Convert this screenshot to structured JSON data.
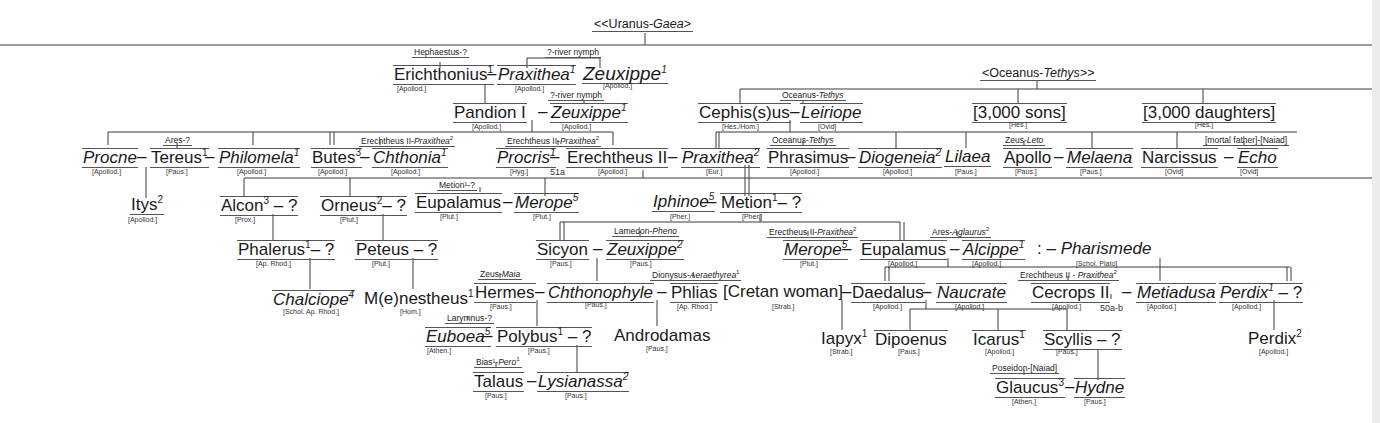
{
  "title_root": {
    "pre": "<<Uranus-",
    "it": "Gaea",
    "post": ">"
  },
  "oceanus_root": {
    "pre": "<Oceanus-",
    "it": "Tethys",
    "post": ">>"
  },
  "parents_labels": {
    "hephaestus": "Hephaestus-?",
    "river1": "?-river nymph",
    "river2": "?-river nymph",
    "ares": "Ares-?",
    "erechtheus_a": {
      "a": "Erechtheus II-",
      "b": "Praxithea",
      "sup": "2"
    },
    "erechtheus_b": {
      "a": "Erechtheus II-",
      "b": "Praxithea",
      "sup": "2"
    },
    "oceanus_a": {
      "a": "Oceanus-",
      "b": "Tethys"
    },
    "oceanus_b": {
      "a": "Oceanus-",
      "b": "Tethys"
    },
    "zeus_leto": {
      "a": "Zeus-",
      "b": "Leto"
    },
    "mortal": "[mortal father]-[Naiad]",
    "metion": "Metion¹-?",
    "lamedon": {
      "a": "Lamedon-",
      "b": "Pheno"
    },
    "erectheus_c": {
      "a": "Erectheus II-",
      "b": "Praxithea",
      "sup": "2"
    },
    "ares_aglaurus": {
      "a": "Ares-",
      "b": "Aglaurus",
      "sup": "2"
    },
    "erechtheus_d": {
      "a": "Erechtheus II - ",
      "b": "Praxithea",
      "sup": "2"
    },
    "zeus_maia": {
      "a": "Zeus-",
      "b": "Maia"
    },
    "dionysus": {
      "a": "Dionysus-",
      "b": "Aeraethyrea",
      "sup": "1"
    },
    "larymnus": "Larymnus-?",
    "bias": {
      "a": "Bias¹-",
      "b": "Pero",
      "sup": "1"
    },
    "poseidon": "Poseidon-[Naiad]"
  },
  "people": {
    "erichthonius": {
      "name": "Erichthonius",
      "sup": "1",
      "src": "[Apollod.]"
    },
    "praxithea1": {
      "name": "Praxithea",
      "sup": "1",
      "src": "[Apollod.]"
    },
    "zeuxippe1": {
      "name": "Zeuxippe",
      "sup": "1",
      "src": "[Apollod.]"
    },
    "pandion": {
      "name": "Pandion I",
      "src": "[Apollod.]"
    },
    "zeuxippe1b": {
      "name": "Zeuxippe",
      "sup": "1",
      "src": "[Apollod.]"
    },
    "cephisus": {
      "name": "Cephis(s)us",
      "src": "[Hes./Hom.]"
    },
    "leiriope": {
      "name": "Leiriope",
      "src": "[Ovid]"
    },
    "sons": {
      "name": "[3,000 sons]",
      "src": "[Hes.]"
    },
    "daughters": {
      "name": "[3,000 daughters]",
      "src": "[Hes.]"
    },
    "procne": {
      "name": "Procne",
      "src": "[Apollod.]"
    },
    "tereus": {
      "name": "Tereus",
      "sup": "1",
      "src": "[Paus.]"
    },
    "philomela": {
      "name": "Philomela",
      "sup": "1",
      "src": "[Apollod.]"
    },
    "butes": {
      "name": "Butes",
      "sup": "3",
      "src": "[Apollod.]"
    },
    "chthonia": {
      "name": "Chthonia",
      "sup": "1",
      "src": "[Apollod.]"
    },
    "procris": {
      "name": "Procris",
      "sup": "1",
      "src": "[Hyg.]"
    },
    "erechtheus": {
      "name": "Erechtheus II",
      "src": "[Apollod.]"
    },
    "praxithea2": {
      "name": "Praxithea",
      "sup": "2",
      "src": "[Eur.]"
    },
    "phrasimus": {
      "name": "Phrasimus",
      "src": "[Apollod.]"
    },
    "diogeneia": {
      "name": "Diogeneia",
      "sup": "2",
      "src": "[Apollod.]"
    },
    "lilaea": {
      "name": "Lilaea",
      "src": "[Paus.]"
    },
    "apollo": {
      "name": "Apollo",
      "src": "[Paus.]"
    },
    "melaena": {
      "name": "Melaena",
      "src": "[Paus.]"
    },
    "narcissus": {
      "name": "Narcissus",
      "src": "[Ovid]"
    },
    "echo": {
      "name": "Echo",
      "src": "[Ovid]"
    },
    "itys": {
      "name": "Itys",
      "sup": "2",
      "src": "[Apollod.]"
    },
    "alcon": {
      "name": "Alcon",
      "sup": "3",
      "tail": " – ?",
      "src": "[Prox.]"
    },
    "orneus": {
      "name": "Orneus",
      "sup": "2",
      "tail": "– ?",
      "src": "[Plut.]"
    },
    "eupalamus1": {
      "name": "Eupalamus",
      "src": "[Plut.]"
    },
    "merope5a": {
      "name": "Merope",
      "sup": "5",
      "src": "[Plut.]"
    },
    "iphinoe": {
      "name": "Iphinoe",
      "sup": "5",
      "src": "[Pher.]"
    },
    "metion": {
      "name": "Metion",
      "sup": "1",
      "tail": "– ?",
      "src": "[Pher.]"
    },
    "phalerus": {
      "name": "Phalerus",
      "sup": "1",
      "tail": "– ?",
      "src": "[Ap. Rhod.]"
    },
    "peteus": {
      "name": "Peteus",
      "tail": " – ?",
      "src": "[Plut.]"
    },
    "sicyon": {
      "name": "Sicyon",
      "src": "[Paus.]"
    },
    "zeuxippe2": {
      "name": "Zeuxippe",
      "sup": "2",
      "src": "[Paus.]"
    },
    "merope5b": {
      "name": "Merope",
      "sup": "5",
      "src": "[Plut.]"
    },
    "eupalamus2": {
      "name": "Eupalamus",
      "src": "[Apollod.]"
    },
    "alcippe": {
      "name": "Alcippe",
      "sup": "1",
      "src": "[Apollod.]"
    },
    "pharismede": {
      "name": "Pharismede",
      "pre": ": – ",
      "src": "[Schol. Plato]"
    },
    "chalciope": {
      "name": "Chalciope",
      "sup": "4",
      "src": "[Schol. Ap. Rhod.]"
    },
    "menestheus": {
      "name": "M(e)nestheus",
      "sup": "1",
      "src": "[Hom.]"
    },
    "hermes": {
      "name": "Hermes",
      "src": "[Paus.]"
    },
    "chthonophyle": {
      "name": "Chthonophyle",
      "src": "[Paus.]"
    },
    "phlias": {
      "name": "Phlias",
      "src": "[Ap. Rhod.]"
    },
    "cretan": {
      "name": "[Cretan woman]",
      "src": "[Strab.]"
    },
    "daedalus": {
      "name": "Daedalus",
      "src": "[Apollod.]"
    },
    "naucrate": {
      "name": "Naucrate",
      "src": "[Apollod.]"
    },
    "cecrops": {
      "name": "Cecrops II",
      "src": "[Apollod.]"
    },
    "metiadusa": {
      "name": "Metiadusa",
      "src": "[Apollod.]"
    },
    "perdix1": {
      "name": "Perdix",
      "sup": "1",
      "tail": " – ?",
      "src": "[Apollod.]"
    },
    "euboea": {
      "name": "Euboea",
      "sup": "5",
      "src": "[Athen.]"
    },
    "polybus": {
      "name": "Polybus",
      "sup": "1",
      "tail": " – ?",
      "src": "[Paus.]"
    },
    "androdamas": {
      "name": "Androdamas",
      "src": "[Paus.]"
    },
    "iapyx": {
      "name": "Iapyx",
      "sup": "1",
      "src": "[Strab.]"
    },
    "dipoenus": {
      "name": "Dipoenus",
      "src": "[Paus.]"
    },
    "icarus": {
      "name": "Icarus",
      "sup": "1",
      "src": "[Apollod.]"
    },
    "scyllis": {
      "name": "Scyllis",
      "tail": " – ?",
      "src": "[Paus.]"
    },
    "perdix2": {
      "name": "Perdix",
      "sup": "2",
      "src": "[Apollod.]"
    },
    "talaus": {
      "name": "Talaus",
      "src": "[Paus.]"
    },
    "lysianassa": {
      "name": "Lysianassa",
      "sup": "2",
      "src": "[Paus.]"
    },
    "glaucus": {
      "name": "Glaucus",
      "sup": "3",
      "src": "[Athen.]"
    },
    "hydne": {
      "name": "Hydne",
      "src": "[Paus.]"
    }
  },
  "refs": {
    "r51a": "51a",
    "r50ab": "50a-b"
  },
  "dash": "–"
}
